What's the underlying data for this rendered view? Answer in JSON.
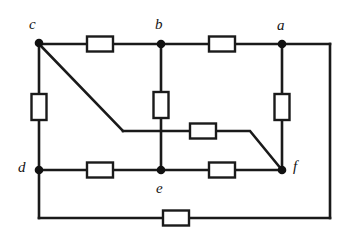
{
  "figure": {
    "kind": "circuit-schematic",
    "background_color": "#ffffff",
    "wire_color": "#1a1a1a",
    "node_color": "#111111",
    "resistor_fill": "#ffffff",
    "resistor_stroke": "#1a1a1a",
    "width": 346,
    "height": 246
  },
  "nodes": [
    {
      "id": "c",
      "label": "c",
      "x": 39,
      "y": 43,
      "label_x": 29,
      "label_y": 17
    },
    {
      "id": "b",
      "label": "b",
      "x": 161,
      "y": 44,
      "label_x": 155,
      "label_y": 17
    },
    {
      "id": "a",
      "label": "a",
      "x": 282,
      "y": 44,
      "label_x": 277,
      "label_y": 18
    },
    {
      "id": "d",
      "label": "d",
      "x": 39,
      "y": 170,
      "label_x": 18,
      "label_y": 160
    },
    {
      "id": "e",
      "label": "e",
      "x": 161,
      "y": 170,
      "label_x": 156,
      "label_y": 181
    },
    {
      "id": "f",
      "label": "f",
      "x": 282,
      "y": 170,
      "label_x": 293,
      "label_y": 159
    }
  ],
  "resistors": [
    {
      "id": "r-cb",
      "between": "c-b",
      "orientation": "horizontal",
      "cx": 100,
      "cy": 44
    },
    {
      "id": "r-ba",
      "between": "b-a",
      "orientation": "horizontal",
      "cx": 222,
      "cy": 44
    },
    {
      "id": "r-cd",
      "between": "c-d",
      "orientation": "vertical",
      "cx": 39,
      "cy": 107
    },
    {
      "id": "r-be",
      "between": "b-e",
      "orientation": "vertical",
      "cx": 161,
      "cy": 105
    },
    {
      "id": "r-af",
      "between": "a-f",
      "orientation": "vertical",
      "cx": 282,
      "cy": 107
    },
    {
      "id": "r-middle",
      "between": "c-f",
      "orientation": "horizontal",
      "cx": 203,
      "cy": 131
    },
    {
      "id": "r-de",
      "between": "d-e",
      "orientation": "horizontal",
      "cx": 100,
      "cy": 170
    },
    {
      "id": "r-ef",
      "between": "e-f",
      "orientation": "horizontal",
      "cx": 222,
      "cy": 170
    },
    {
      "id": "r-bottom",
      "between": "d-a-loop",
      "orientation": "horizontal",
      "cx": 176,
      "cy": 218
    }
  ],
  "wires": [
    {
      "id": "w-c-to-r-cb",
      "points": "39,44 87,44"
    },
    {
      "id": "w-r-cb-to-b",
      "points": "113,44 161,44"
    },
    {
      "id": "w-b-to-r-ba",
      "points": "161,44 209,44"
    },
    {
      "id": "w-r-ba-to-a",
      "points": "235,44 282,44"
    },
    {
      "id": "w-a-to-right-rail",
      "points": "282,44 330,44"
    },
    {
      "id": "w-right-rail",
      "points": "330,44 330,218"
    },
    {
      "id": "w-bottom-right",
      "points": "330,218 189,218"
    },
    {
      "id": "w-bottom-left",
      "points": "163,218 39,218"
    },
    {
      "id": "w-d-to-bottom",
      "points": "39,170 39,218"
    },
    {
      "id": "w-c-to-r-cd",
      "points": "39,44 39,94"
    },
    {
      "id": "w-r-cd-to-d",
      "points": "39,120 39,170"
    },
    {
      "id": "w-b-to-r-be",
      "points": "161,44 161,92"
    },
    {
      "id": "w-r-be-to-e",
      "points": "161,118 161,170"
    },
    {
      "id": "w-a-to-r-af",
      "points": "282,44 282,94"
    },
    {
      "id": "w-r-af-to-f",
      "points": "282,120 282,170"
    },
    {
      "id": "w-c-diagonal",
      "points": "39,44 123,131"
    },
    {
      "id": "w-mid-to-r",
      "points": "123,131 190,131"
    },
    {
      "id": "w-r-to-f-diag",
      "points": "216,131 250,131 282,170"
    },
    {
      "id": "w-d-to-r-de",
      "points": "39,170 87,170"
    },
    {
      "id": "w-r-de-to-e",
      "points": "113,170 161,170"
    },
    {
      "id": "w-e-to-r-ef",
      "points": "161,170 209,170"
    },
    {
      "id": "w-r-ef-to-f",
      "points": "235,170 282,170"
    }
  ]
}
